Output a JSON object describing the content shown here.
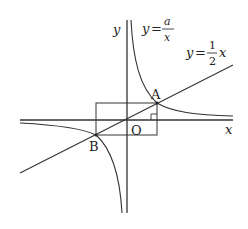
{
  "diagram": {
    "type": "coordinate-graph",
    "axes": {
      "x_label": "x",
      "y_label": "y",
      "origin_label": "O"
    },
    "curves": [
      {
        "name": "hyperbola",
        "equation_lhs": "y",
        "equation_eq": "=",
        "numerator": "a",
        "denominator": "x"
      },
      {
        "name": "line",
        "equation_lhs": "y",
        "equation_eq": "=",
        "coef_num": "1",
        "coef_den": "2",
        "var": "x"
      }
    ],
    "points": [
      {
        "label": "A"
      },
      {
        "label": "B"
      }
    ],
    "annotations": {
      "rectangle_through_A_and_B": true,
      "right_angle_marker": true
    }
  }
}
